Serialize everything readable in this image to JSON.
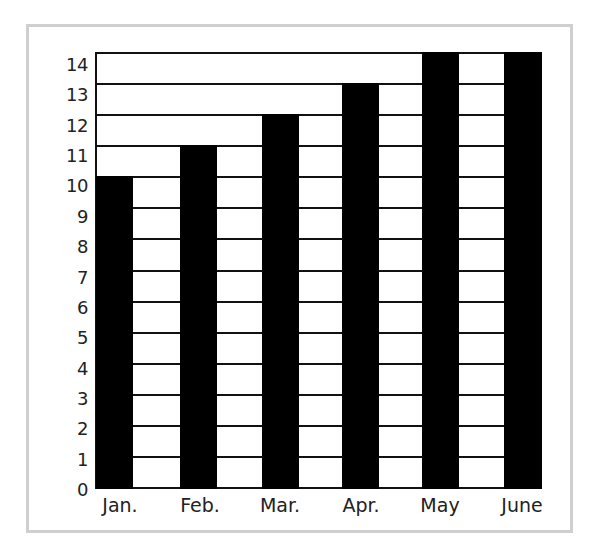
{
  "chart_data": {
    "type": "bar",
    "title": "",
    "xlabel": "",
    "ylabel": "",
    "categories": [
      "Jan.",
      "Feb.",
      "Mar.",
      "Apr.",
      "May",
      "June"
    ],
    "values": [
      10,
      11,
      12,
      13,
      14,
      14
    ],
    "ylim": [
      0,
      14
    ],
    "yticks": [
      "0",
      "1",
      "2",
      "3",
      "4",
      "5",
      "6",
      "7",
      "8",
      "9",
      "10",
      "11",
      "12",
      "13",
      "14"
    ],
    "grid": true,
    "legend": null,
    "colors": {
      "bar": "#000000",
      "grid": "#111111",
      "frame": "#cfcfcf",
      "text": "#222222"
    }
  }
}
